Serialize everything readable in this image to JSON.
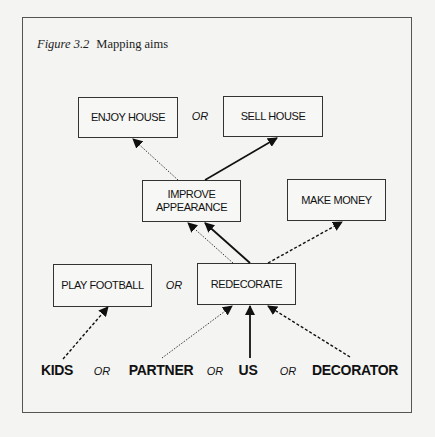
{
  "caption": {
    "figure_label": "Figure 3.2",
    "title": "Mapping aims"
  },
  "nodes": {
    "enjoy_house": "ENJOY HOUSE",
    "sell_house": "SELL HOUSE",
    "improve_appearance": "IMPROVE\nAPPEARANCE",
    "make_money": "MAKE MONEY",
    "play_football": "PLAY FOOTBALL",
    "redecorate": "REDECORATE"
  },
  "actors": {
    "kids": "KIDS",
    "partner": "PARTNER",
    "us": "US",
    "decorator": "DECORATOR"
  },
  "connectors": {
    "or_top": "OR",
    "or_middle": "OR",
    "or_actor_1": "OR",
    "or_actor_2": "OR",
    "or_actor_3": "OR"
  },
  "edges": [
    {
      "from": "IMPROVE APPEARANCE",
      "to": "ENJOY HOUSE",
      "style": "dotted"
    },
    {
      "from": "IMPROVE APPEARANCE",
      "to": "SELL HOUSE",
      "style": "solid"
    },
    {
      "from": "REDECORATE",
      "to": "IMPROVE APPEARANCE",
      "style": "dotted"
    },
    {
      "from": "REDECORATE",
      "to": "IMPROVE APPEARANCE",
      "style": "solid"
    },
    {
      "from": "REDECORATE",
      "to": "MAKE MONEY",
      "style": "dashed"
    },
    {
      "from": "KIDS",
      "to": "PLAY FOOTBALL",
      "style": "dashed"
    },
    {
      "from": "PARTNER",
      "to": "REDECORATE",
      "style": "dotted"
    },
    {
      "from": "US",
      "to": "REDECORATE",
      "style": "solid"
    },
    {
      "from": "DECORATOR",
      "to": "REDECORATE",
      "style": "dashed"
    }
  ]
}
